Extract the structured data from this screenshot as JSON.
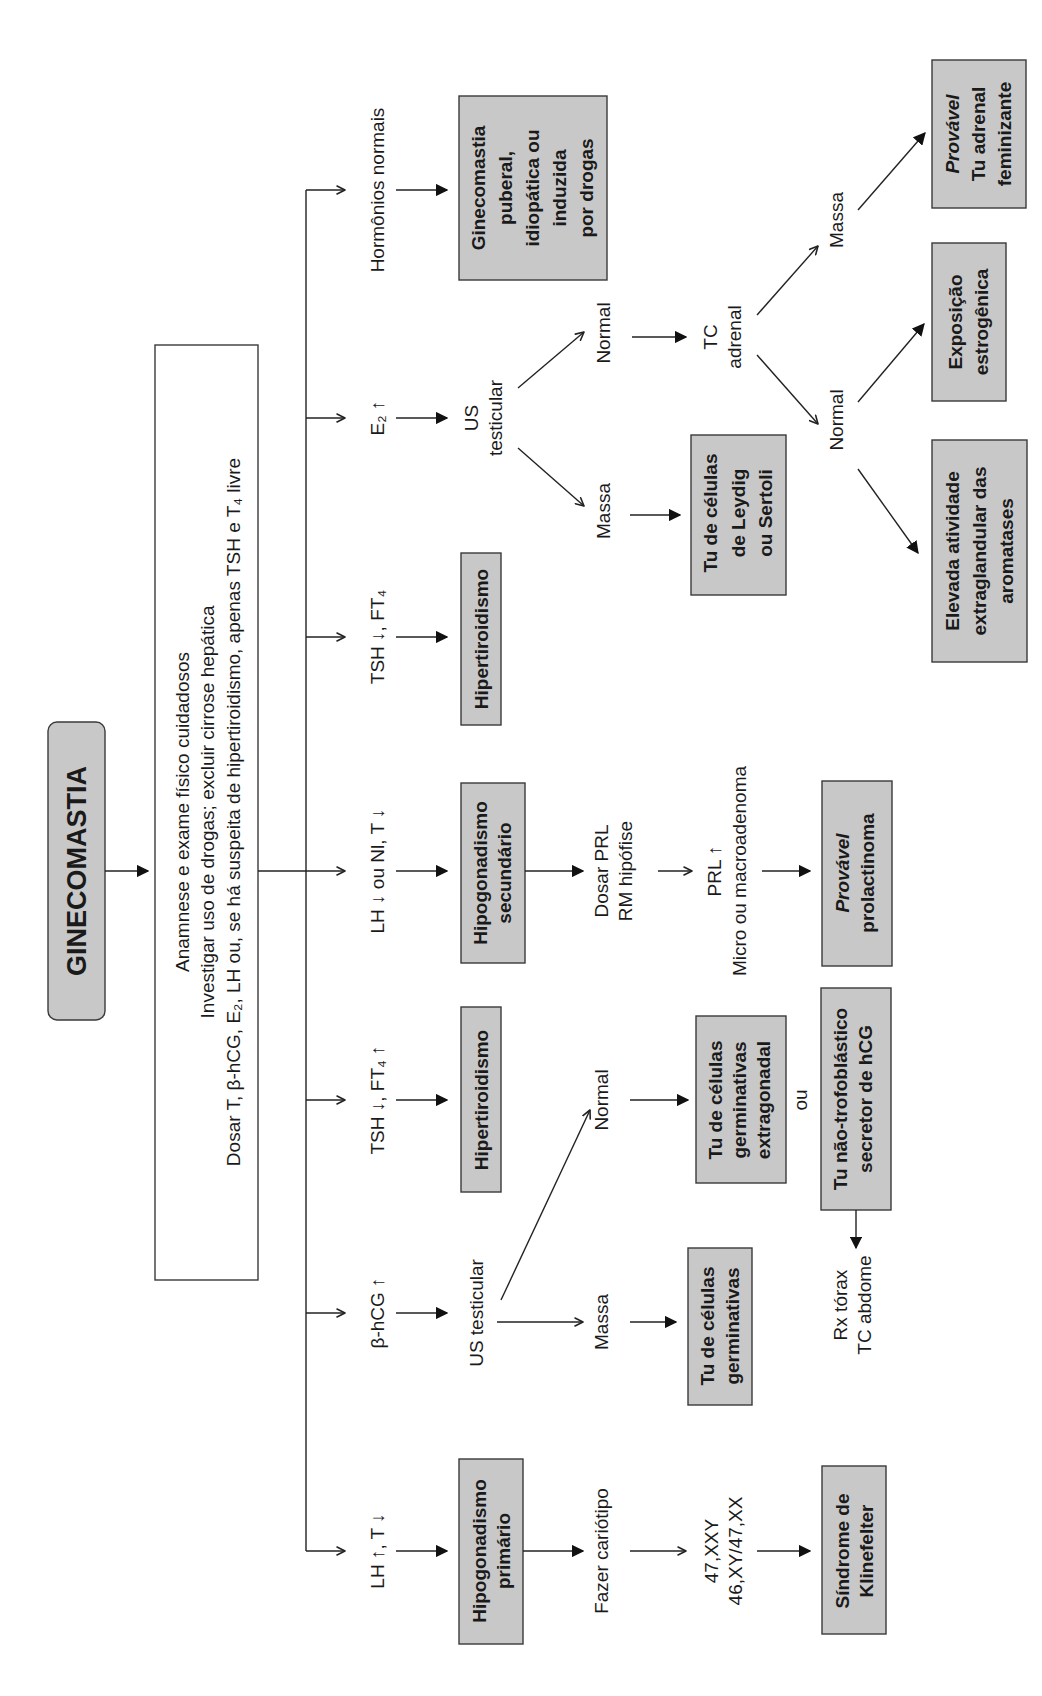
{
  "diagram": {
    "title": "GINECOMASTIA",
    "orientation": "rotated 90° counter-clockwise",
    "instructions": {
      "line1": "Anamnese e exame físico cuidadosos",
      "line2": "Investigar uso de drogas; excluir cirrose hepática",
      "line3": "Dosar T, β-hCG, E₂, LH ou, se há suspeita de hipertiroidismo, apenas TSH e T₄ livre"
    },
    "branches": [
      {
        "id": "lh-high",
        "condition": "LH ↑, T ↓",
        "result": [
          "Hipogonadismo",
          "primário"
        ],
        "next_step": "Fazer cariótipo",
        "finding": [
          "47,XXY",
          "46,XY/47,XX"
        ],
        "diagnosis": [
          "Síndrome de",
          "Klinefelter"
        ]
      },
      {
        "id": "bhcg-high",
        "condition": "β-hCG ↑",
        "exam": "US testicular",
        "outcomes": [
          {
            "label": "Massa",
            "diagnosis": [
              "Tu de células",
              "germinativas"
            ]
          },
          {
            "label": "Normal",
            "diagnosis": [
              "Tu de células",
              "germinativas",
              "extragonadal"
            ],
            "or_label": "ou",
            "alternative": [
              "Tu não-trofoblástico",
              "secretor de hCG"
            ],
            "followup": [
              "Rx tórax",
              "TC abdome"
            ]
          }
        ]
      },
      {
        "id": "tsh-low-ft4-high",
        "condition": "TSH ↓, FT₄ ↑",
        "result": [
          "Hipertiroidismo"
        ]
      },
      {
        "id": "lh-low",
        "condition": "LH ↓ ou Nl, T ↓",
        "result": [
          "Hipogonadismo",
          "secundário"
        ],
        "next_step": [
          "Dosar PRL",
          "RM hipófise"
        ],
        "finding": [
          "PRL ↑",
          "Micro ou macroadenoma"
        ],
        "diagnosis_italic": "Provável",
        "diagnosis": "prolactinoma"
      },
      {
        "id": "tsh-low-ft4",
        "condition": "TSH ↓, FT₄",
        "result": [
          "Hipertiroidismo"
        ]
      },
      {
        "id": "e2-high",
        "condition": "E₂ ↑",
        "exam": [
          "US",
          "testicular"
        ],
        "outcomes": [
          {
            "label": "Massa",
            "diagnosis": [
              "Tu de células",
              "de Leydig",
              "ou Sertoli"
            ]
          },
          {
            "label": "Normal",
            "exam": [
              "TC",
              "adrenal"
            ],
            "outcomes": [
              {
                "label": "Normal",
                "diagnoses": [
                  [
                    "Elevada atividade",
                    "extraglandular das",
                    "aromatases"
                  ],
                  [
                    "Exposição",
                    "estrogênica"
                  ]
                ]
              },
              {
                "label": "Massa",
                "diagnosis_italic": "Provável",
                "diagnosis": [
                  "Tu adrenal",
                  "feminizante"
                ]
              }
            ]
          }
        ]
      },
      {
        "id": "normal",
        "condition": "Hormônios normais",
        "result": [
          "Ginecomastia",
          "puberal,",
          "idiopática ou",
          "induzida",
          "por drogas"
        ]
      }
    ]
  },
  "colors": {
    "box_fill": "#c8c8c8",
    "box_stroke": "#3a3a3a",
    "line": "#222222",
    "text": "#1a1a1a",
    "background": "#ffffff"
  }
}
